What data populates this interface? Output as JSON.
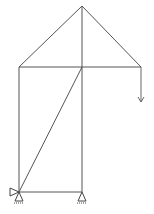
{
  "diagram": {
    "type": "truss-structure",
    "colors": {
      "member": "#555555",
      "support": "#444444",
      "load": "#666666",
      "background": "#ffffff"
    },
    "nodes": [
      {
        "id": "apex",
        "x": 82,
        "y": 6
      },
      {
        "id": "left-mid",
        "x": 19,
        "y": 67
      },
      {
        "id": "center-mid",
        "x": 82,
        "y": 67
      },
      {
        "id": "right-mid",
        "x": 141,
        "y": 67
      },
      {
        "id": "bottom-left",
        "x": 19,
        "y": 192
      },
      {
        "id": "bottom-center",
        "x": 82,
        "y": 192
      }
    ],
    "members": [
      {
        "from": "apex",
        "to": "left-mid"
      },
      {
        "from": "apex",
        "to": "right-mid"
      },
      {
        "from": "apex",
        "to": "center-mid"
      },
      {
        "from": "left-mid",
        "to": "right-mid"
      },
      {
        "from": "left-mid",
        "to": "bottom-left"
      },
      {
        "from": "center-mid",
        "to": "bottom-center"
      },
      {
        "from": "center-mid",
        "to": "bottom-left"
      },
      {
        "from": "bottom-left",
        "to": "bottom-center"
      }
    ],
    "supports": [
      {
        "node": "bottom-left",
        "type": "pin-vertical"
      },
      {
        "node": "bottom-left",
        "type": "pin-horizontal"
      },
      {
        "node": "bottom-center",
        "type": "pin-vertical"
      }
    ],
    "loads": [
      {
        "node": "right-mid",
        "direction": "down",
        "length": 35
      }
    ]
  }
}
